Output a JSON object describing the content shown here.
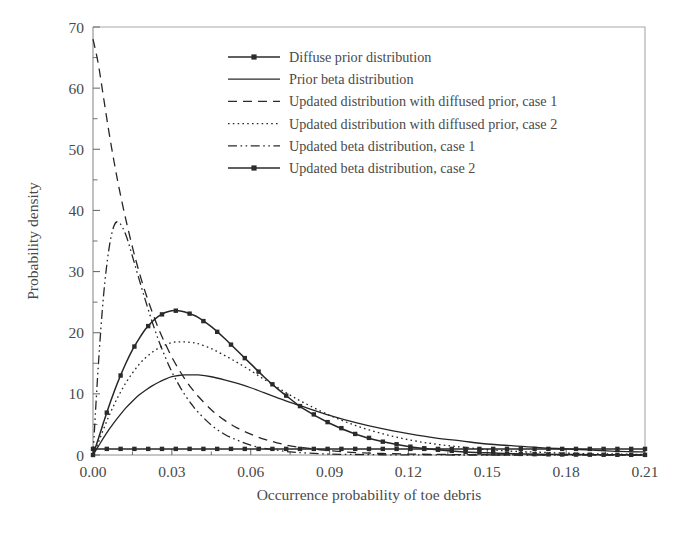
{
  "figure": {
    "background_color": "#ffffff",
    "ink_color": "#2b2b2b",
    "frame_color": "#a8a8a8"
  },
  "axes": {
    "x": {
      "label": "Occurrence probability of toe debris",
      "ticks": [
        "0.00",
        "0.03",
        "0.06",
        "0.09",
        "0.12",
        "0.15",
        "0.18",
        "0.21"
      ],
      "tick_values": [
        0,
        0.03,
        0.06,
        0.09,
        0.12,
        0.15,
        0.18,
        0.21
      ],
      "min": 0,
      "max": 0.21
    },
    "y": {
      "label": "Probability density",
      "ticks": [
        "0",
        "10",
        "20",
        "30",
        "40",
        "50",
        "60",
        "70"
      ],
      "tick_values": [
        0,
        10,
        20,
        30,
        40,
        50,
        60,
        70
      ],
      "minor_tick_values": [
        5,
        15,
        25,
        35,
        45,
        55,
        65
      ],
      "min": 0,
      "max": 70
    }
  },
  "legend": {
    "position": "top-center-right",
    "entries": [
      {
        "label": "Diffuse prior distribution",
        "style": "solid-marker",
        "marker": "square"
      },
      {
        "label": "Prior beta distribution",
        "style": "solid",
        "marker": "none"
      },
      {
        "label": "Updated distribution with diffused prior, case 1",
        "style": "dashed",
        "marker": "none"
      },
      {
        "label": "Updated distribution with diffused prior, case 2",
        "style": "dotted",
        "marker": "none"
      },
      {
        "label": "Updated beta distribution, case 1",
        "style": "dash-dot-dot",
        "marker": "none"
      },
      {
        "label": "Updated beta distribution, case 2",
        "style": "solid-marker",
        "marker": "square"
      }
    ]
  },
  "chart_data": {
    "type": "line",
    "title": "",
    "xlabel": "Occurrence probability of toe debris",
    "ylabel": "Probability density",
    "xlim": [
      0,
      0.21
    ],
    "ylim": [
      0,
      70
    ],
    "grid": false,
    "legend_position": "upper center",
    "x": [
      0.0,
      0.002,
      0.004,
      0.006,
      0.008,
      0.01,
      0.0125,
      0.015,
      0.0175,
      0.02,
      0.0225,
      0.025,
      0.0275,
      0.03,
      0.0325,
      0.035,
      0.0375,
      0.04,
      0.045,
      0.05,
      0.055,
      0.06,
      0.065,
      0.07,
      0.075,
      0.08,
      0.09,
      0.1,
      0.11,
      0.12,
      0.13,
      0.14,
      0.15,
      0.16,
      0.17,
      0.18,
      0.19,
      0.2,
      0.21
    ],
    "series": [
      {
        "name": "Diffuse prior distribution",
        "style": "solid-marker",
        "marker": "square",
        "values": [
          1.0,
          1.0,
          1.0,
          1.0,
          1.0,
          1.0,
          1.0,
          1.0,
          1.0,
          1.0,
          1.0,
          1.0,
          1.0,
          1.0,
          1.0,
          1.0,
          1.0,
          1.0,
          1.0,
          1.0,
          1.0,
          1.0,
          1.0,
          1.0,
          1.0,
          1.0,
          1.0,
          1.0,
          1.0,
          1.0,
          1.0,
          1.0,
          1.0,
          1.0,
          1.0,
          1.0,
          1.0,
          1.0,
          1.0
        ]
      },
      {
        "name": "Prior beta distribution",
        "style": "solid",
        "marker": "none",
        "values": [
          0.0,
          1.4,
          2.8,
          4.1,
          5.3,
          6.4,
          7.7,
          8.8,
          9.8,
          10.6,
          11.3,
          11.9,
          12.4,
          12.8,
          13.0,
          13.1,
          13.1,
          13.1,
          12.8,
          12.3,
          11.7,
          11.0,
          10.2,
          9.4,
          8.6,
          7.9,
          6.5,
          5.3,
          4.3,
          3.5,
          2.8,
          2.3,
          1.8,
          1.5,
          1.2,
          1.0,
          0.8,
          0.6,
          0.5
        ]
      },
      {
        "name": "Updated distribution with diffused prior, case 1",
        "style": "dashed",
        "marker": "none",
        "values": [
          68.0,
          64.0,
          58.5,
          53.0,
          48.0,
          43.5,
          38.5,
          34.0,
          30.0,
          26.5,
          23.4,
          20.6,
          18.2,
          16.0,
          14.1,
          12.4,
          10.9,
          9.6,
          7.4,
          5.7,
          4.4,
          3.4,
          2.6,
          2.0,
          1.5,
          1.2,
          0.7,
          0.4,
          0.25,
          0.15,
          0.1,
          0.06,
          0.04,
          0.02,
          0.02,
          0.01,
          0.01,
          0.0,
          0.0
        ]
      },
      {
        "name": "Updated distribution with diffused prior, case 2",
        "style": "dotted",
        "marker": "none",
        "values": [
          0.0,
          2.0,
          4.2,
          6.3,
          8.2,
          9.9,
          11.8,
          13.4,
          14.8,
          15.9,
          16.8,
          17.5,
          18.0,
          18.4,
          18.5,
          18.5,
          18.4,
          18.2,
          17.4,
          16.3,
          15.1,
          13.8,
          12.4,
          11.1,
          9.8,
          8.6,
          6.5,
          4.8,
          3.5,
          2.5,
          1.8,
          1.3,
          0.9,
          0.6,
          0.45,
          0.3,
          0.2,
          0.15,
          0.1
        ]
      },
      {
        "name": "Updated beta distribution, case 1",
        "style": "dash-dot-dot",
        "marker": "none",
        "values": [
          0.0,
          14.5,
          26.0,
          33.5,
          37.5,
          38.0,
          36.0,
          32.5,
          28.8,
          25.2,
          21.8,
          18.7,
          16.0,
          13.6,
          11.6,
          9.8,
          8.3,
          7.0,
          4.9,
          3.4,
          2.4,
          1.6,
          1.1,
          0.8,
          0.5,
          0.35,
          0.15,
          0.08,
          0.04,
          0.02,
          0.01,
          0.0,
          0.0,
          0.0,
          0.0,
          0.0,
          0.0,
          0.0,
          0.0
        ]
      },
      {
        "name": "Updated beta distribution, case 2",
        "style": "solid-marker",
        "marker": "square",
        "values": [
          0.0,
          2.6,
          5.3,
          7.9,
          10.3,
          12.5,
          15.0,
          17.2,
          19.0,
          20.6,
          21.8,
          22.7,
          23.3,
          23.6,
          23.6,
          23.4,
          23.0,
          22.5,
          21.0,
          19.1,
          17.0,
          14.9,
          12.8,
          10.9,
          9.2,
          7.6,
          5.2,
          3.4,
          2.2,
          1.4,
          0.9,
          0.55,
          0.35,
          0.2,
          0.12,
          0.08,
          0.05,
          0.03,
          0.02
        ]
      }
    ]
  }
}
